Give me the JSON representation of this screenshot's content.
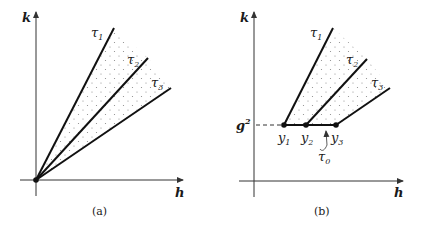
{
  "panels": [
    {
      "id": "a",
      "caption": "(a)",
      "axes": {
        "x_label": "h",
        "y_label": "k"
      },
      "origin_point": "origin",
      "rays": [
        {
          "label": "τ",
          "sub": "1"
        },
        {
          "label": "τ",
          "sub": "2"
        },
        {
          "label": "τ",
          "sub": "3"
        }
      ],
      "shaded_region": "dotted cone between τ1 and τ3"
    },
    {
      "id": "b",
      "caption": "(b)",
      "axes": {
        "x_label": "h",
        "y_label": "k"
      },
      "level_label": {
        "base": "g",
        "sup": "2"
      },
      "points": [
        {
          "label": "y",
          "sub": "1"
        },
        {
          "label": "y",
          "sub": "2"
        },
        {
          "label": "y",
          "sub": "3"
        }
      ],
      "segment_label": {
        "label": "τ",
        "sub": "0"
      },
      "rays": [
        {
          "label": "τ",
          "sub": "1"
        },
        {
          "label": "τ",
          "sub": "2"
        },
        {
          "label": "τ",
          "sub": "3"
        }
      ],
      "shaded_region": "dotted region above τ0 between τ1 and τ3"
    }
  ],
  "colors": {
    "ink": "#1a1a1a",
    "axis": "#333333",
    "dots": "#888888"
  }
}
